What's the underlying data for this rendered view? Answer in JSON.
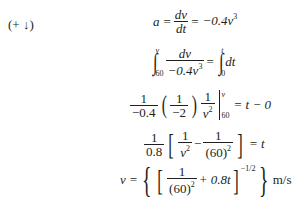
{
  "sign_convention": {
    "label": "(+ ↓)"
  },
  "equations": [
    {
      "id": "acceleration",
      "lhs": "a",
      "eq1": "=",
      "frac_num": "dv",
      "frac_den": "dt",
      "eq2": "=",
      "rhs": "−0.4v",
      "rhs_exp": "3"
    },
    {
      "id": "integral",
      "int1_upper": "v",
      "int1_lower": "60",
      "frac_num": "dv",
      "frac_den": "−0.4v",
      "frac_den_exp": "3",
      "eq": "=",
      "int2_upper": "t",
      "int2_lower": "0",
      "integrand2": "dt"
    },
    {
      "id": "evaluated",
      "f1_num": "1",
      "f1_den": "−0.4",
      "f2_num": "1",
      "f2_den": "−2",
      "f3_num": "1",
      "f3_den": "v",
      "f3_den_exp": "2",
      "eval_upper": "v",
      "eval_lower": "60",
      "rhs": "= t − 0"
    },
    {
      "id": "simplified",
      "f1_num": "1",
      "f1_den": "0.8",
      "f2_num": "1",
      "f2_den": "v",
      "f2_den_exp": "2",
      "minus": "−",
      "f3_num": "1",
      "f3_den": "(60)",
      "f3_den_exp": "2",
      "rhs": "= t"
    },
    {
      "id": "velocity",
      "lhs": "v =",
      "f_num": "1",
      "f_den": "(60)",
      "f_den_exp": "2",
      "plus_term": "+ 0.8t",
      "outer_exp": "−1/2",
      "units": "m/s"
    }
  ]
}
